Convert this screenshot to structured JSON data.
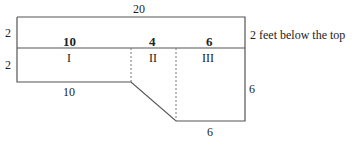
{
  "diagram": {
    "type": "pool cross-section",
    "dimensions": {
      "top_width": "20",
      "upper_depth": "2",
      "lower_left_depth": "2",
      "right_depth": "6",
      "left_bottom_length": "10",
      "right_bottom_length": "6"
    },
    "section_widths": {
      "I": "10",
      "II": "4",
      "III": "6"
    },
    "section_labels": [
      "I",
      "II",
      "III"
    ],
    "annotation": "2 feet below the top",
    "line_color": "#555555"
  }
}
